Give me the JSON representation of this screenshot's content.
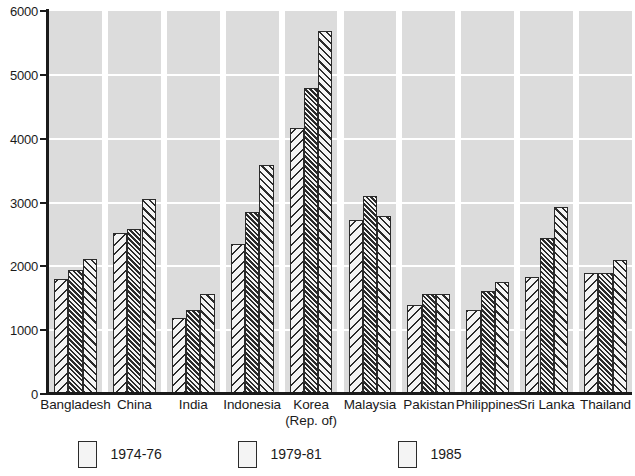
{
  "chart_data": {
    "type": "bar",
    "title": "",
    "subtitle": "",
    "xlabel": "",
    "ylabel": "",
    "ylim": [
      0,
      6000
    ],
    "ytick_values": [
      0,
      1000,
      2000,
      3000,
      4000,
      5000,
      6000
    ],
    "ytick_labels": [
      "0",
      "1000",
      "2000",
      "3000",
      "4000",
      "5000",
      "6000"
    ],
    "grid": true,
    "legend_position": "bottom",
    "orientation": "vertical",
    "grouping": "grouped",
    "categories": [
      "Bangladesh",
      "China",
      "India",
      "Indonesia",
      "Korea",
      "Malaysia",
      "Pakistan",
      "Philippines",
      "Sri Lanka",
      "Thailand"
    ],
    "category_sublabels": [
      "",
      "",
      "",
      "",
      "(Rep. of)",
      "",
      "",
      "",
      "",
      ""
    ],
    "series": [
      {
        "name": "1974-76",
        "pattern": "diagonal-hatch-wide",
        "values": [
          1800,
          2530,
          1190,
          2350,
          4170,
          2720,
          1400,
          1320,
          1830,
          1890
        ]
      },
      {
        "name": "1979-81",
        "pattern": "diagonal-hatch-dense",
        "values": [
          1950,
          2580,
          1310,
          2850,
          4800,
          3100,
          1570,
          1620,
          2440,
          1900
        ]
      },
      {
        "name": "1985",
        "pattern": "diagonal-hatch-medium",
        "values": [
          2110,
          3050,
          1560,
          3580,
          5680,
          2790,
          1560,
          1760,
          2930,
          2100
        ]
      }
    ],
    "colors": {
      "plot_background": "#dcdcdc",
      "gridline": "#ffffff",
      "axis": "#1a1a1a",
      "bar_outline": "#2b2b2b",
      "bar_fill": "#f4f4f4",
      "page_background": "#ffffff"
    }
  }
}
